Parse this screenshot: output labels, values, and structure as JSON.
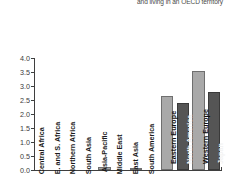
{
  "title": {
    "partial_text": "and living in an OECD territory"
  },
  "chart_data": {
    "type": "bar",
    "title": "and living in an OECD territory",
    "xlabel": "",
    "ylabel": "",
    "ylim": [
      0.0,
      4.0
    ],
    "ytick_labels": [
      "0.0",
      "0.5",
      "1.0",
      "1.5",
      "2.0",
      "2.5",
      "3.0",
      "3.5",
      "4.0"
    ],
    "ytick_values": [
      0.0,
      0.5,
      1.0,
      1.5,
      2.0,
      2.5,
      3.0,
      3.5,
      4.0
    ],
    "grid": false,
    "legend": "none",
    "categories": [
      "Central Africa",
      "E. and S. Africa",
      "Northern Africa",
      "South Asia",
      "Asia-Pacific",
      "Middle East",
      "East Asia",
      "South America",
      "Eastern Europe",
      "North America",
      "Western Europe",
      "Japan"
    ],
    "values": [
      0.0,
      0.0,
      0.0,
      0.0,
      0.11,
      0.0,
      0.03,
      0.0,
      2.65,
      2.4,
      3.52,
      2.8
    ],
    "bar_colors": [
      "#a9a9a9",
      "#555555",
      "#a9a9a9",
      "#555555",
      "#a9a9a9",
      "#555555",
      "#a9a9a9",
      "#555555",
      "#a9a9a9",
      "#555555",
      "#a9a9a9",
      "#555555"
    ],
    "label_placement": [
      "outside",
      "outside",
      "outside",
      "outside",
      "outside",
      "outside",
      "outside",
      "outside",
      "inside",
      "inside",
      "inside",
      "inside"
    ]
  },
  "colors": {
    "light_bar": "#a9a9a9",
    "dark_bar": "#555555",
    "axis": "#3f3f3f",
    "background": "#ffffff",
    "tick_text": "#3a3a3a"
  }
}
